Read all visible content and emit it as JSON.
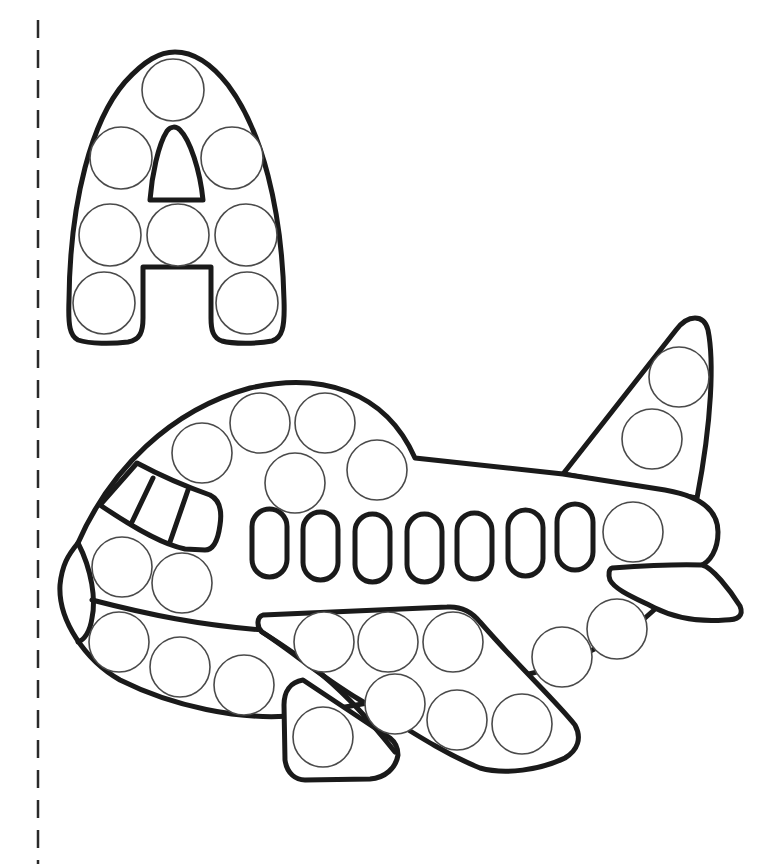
{
  "worksheet": {
    "letter": "A",
    "subject": "airplane",
    "activity": "dot marker coloring page",
    "colors": {
      "line": "#1a1a1a",
      "dot_outline": "#4a4a4a",
      "background": "#ffffff",
      "cut_line": "#2a2a2a"
    }
  },
  "cut_line": {
    "x": 38,
    "y_start": 20,
    "y_end": 864,
    "dash": 18,
    "gap": 12
  },
  "letter_a": {
    "label": "A",
    "dot_radius": 31,
    "dots": [
      {
        "cx": 173,
        "cy": 90
      },
      {
        "cx": 121,
        "cy": 158
      },
      {
        "cx": 232,
        "cy": 158
      },
      {
        "cx": 110,
        "cy": 235
      },
      {
        "cx": 178,
        "cy": 235
      },
      {
        "cx": 246,
        "cy": 235
      },
      {
        "cx": 104,
        "cy": 303
      },
      {
        "cx": 247,
        "cy": 303
      }
    ]
  },
  "airplane": {
    "label": "airplane",
    "dot_radius": 30,
    "window_count": 7,
    "windows": [
      {
        "x": 252,
        "y": 509,
        "w": 35,
        "h": 68
      },
      {
        "x": 303,
        "y": 512,
        "w": 35,
        "h": 68
      },
      {
        "x": 355,
        "y": 514,
        "w": 35,
        "h": 68
      },
      {
        "x": 407,
        "y": 514,
        "w": 35,
        "h": 68
      },
      {
        "x": 457,
        "y": 513,
        "w": 35,
        "h": 66
      },
      {
        "x": 508,
        "y": 510,
        "w": 35,
        "h": 66
      },
      {
        "x": 557,
        "y": 504,
        "w": 36,
        "h": 66
      }
    ],
    "fuselage_dots": [
      {
        "cx": 202,
        "cy": 453
      },
      {
        "cx": 260,
        "cy": 423
      },
      {
        "cx": 325,
        "cy": 423
      },
      {
        "cx": 295,
        "cy": 483
      },
      {
        "cx": 377,
        "cy": 470
      },
      {
        "cx": 122,
        "cy": 567
      },
      {
        "cx": 182,
        "cy": 583
      },
      {
        "cx": 633,
        "cy": 532
      }
    ],
    "belly_dots": [
      {
        "cx": 119,
        "cy": 642
      },
      {
        "cx": 180,
        "cy": 667
      },
      {
        "cx": 244,
        "cy": 685
      },
      {
        "cx": 562,
        "cy": 657
      },
      {
        "cx": 617,
        "cy": 629
      }
    ],
    "tail_dots": [
      {
        "cx": 679,
        "cy": 377
      },
      {
        "cx": 652,
        "cy": 439
      }
    ],
    "wing_dots": [
      {
        "cx": 324,
        "cy": 642
      },
      {
        "cx": 388,
        "cy": 642
      },
      {
        "cx": 453,
        "cy": 642
      },
      {
        "cx": 395,
        "cy": 704
      },
      {
        "cx": 457,
        "cy": 720
      },
      {
        "cx": 522,
        "cy": 724
      }
    ],
    "engine_dots": [
      {
        "cx": 323,
        "cy": 737
      }
    ]
  }
}
